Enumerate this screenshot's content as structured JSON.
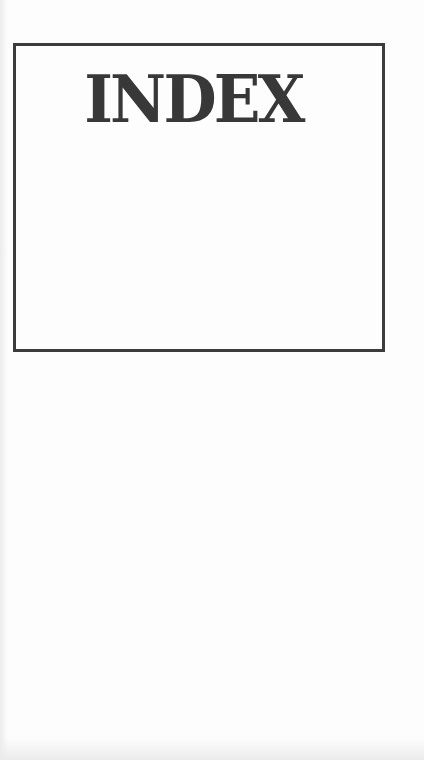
{
  "page": {
    "title": "INDEX",
    "colors": {
      "background": "#fdfdfd",
      "border": "#3c3c3c",
      "text": "#383838"
    }
  }
}
